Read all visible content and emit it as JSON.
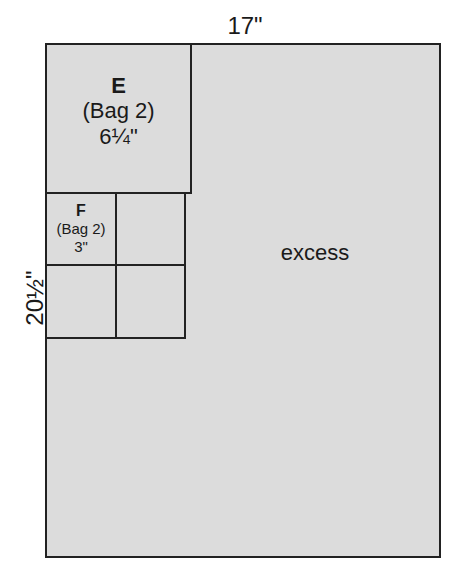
{
  "diagram": {
    "dimensions": {
      "width": "17\"",
      "height": "20½\""
    },
    "pieces": [
      {
        "letter": "E",
        "bag": "(Bag 2)",
        "size": "6¼\""
      },
      {
        "letter": "F",
        "bag": "(Bag 2)",
        "size": "3\""
      }
    ],
    "excess_label": "excess"
  }
}
